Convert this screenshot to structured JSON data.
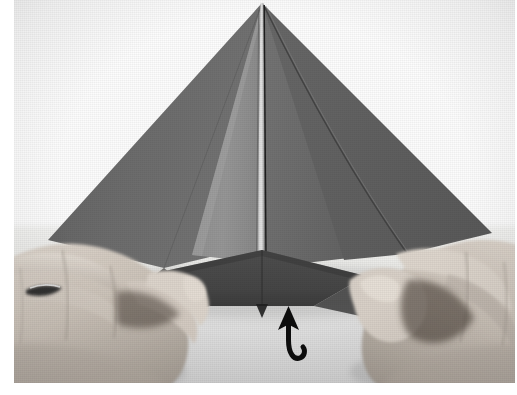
{
  "page": {
    "kind": "photograph",
    "background_color": "#ffffff",
    "caption": ""
  },
  "photo": {
    "x": 14,
    "y": 0,
    "width": 501,
    "height": 383,
    "backdrop_color": "#fdfdfd",
    "table_color": "#dedede",
    "alt": "Two hands holding a folded gray paper kite shape on a white table"
  },
  "paper": {
    "name": "folded-paper-model",
    "base_color": "#6f6f6f",
    "shadow_color": "#3e3e3e",
    "highlight_color": "#9a9a9a",
    "crease_color": "#2b2b2b",
    "apex": {
      "x": 248,
      "y": 3
    },
    "left_point": {
      "x": 34,
      "y": 240
    },
    "right_point": {
      "x": 478,
      "y": 233
    },
    "center_ridge_x": 248,
    "panels": [
      {
        "name": "left-wing",
        "tone": "#676767"
      },
      {
        "name": "left-inner-panel",
        "tone": "#8d8d8d"
      },
      {
        "name": "center-ridge",
        "tone": "#d8d8d8"
      },
      {
        "name": "right-wing",
        "tone": "#6a6a6a"
      },
      {
        "name": "right-outer-wing",
        "tone": "#636363"
      },
      {
        "name": "bottom-flap",
        "tone": "#4a4a4a"
      }
    ]
  },
  "hands": {
    "left": {
      "name": "left-hand",
      "skin_color": "#cfc6bd",
      "shadow_color": "#8d857c",
      "has_ring": true,
      "ring_color": "#2f2f2f"
    },
    "right": {
      "name": "right-hand",
      "skin_color": "#cfc6bd",
      "shadow_color": "#8a8279",
      "has_ring": false
    }
  },
  "annotation": {
    "arrow": {
      "name": "tuck-under-arrow",
      "type": "curved-hook-arrow",
      "color": "#0d0d0d",
      "direction": "up",
      "meaning": "fold-inside",
      "x": 248,
      "y": 306,
      "width": 60,
      "height": 62
    }
  }
}
